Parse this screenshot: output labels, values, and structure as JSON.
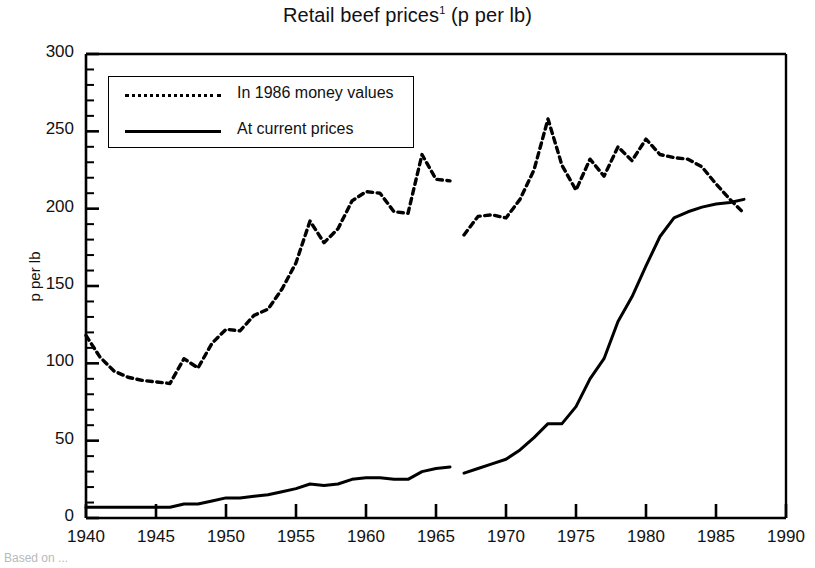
{
  "chart_data": {
    "type": "line",
    "title_main": "Retail beef prices",
    "title_superscript": "1",
    "title_suffix": " (p per lb)",
    "xlabel": "",
    "ylabel": "p per lb",
    "xlim": [
      1940,
      1990
    ],
    "ylim": [
      0,
      300
    ],
    "x_major_ticks": [
      1940,
      1945,
      1950,
      1955,
      1960,
      1965,
      1970,
      1975,
      1980,
      1985,
      1990
    ],
    "x_tick_labels": [
      "1940",
      "1945",
      "1950",
      "1955",
      "1960",
      "1965",
      "1970",
      "1975",
      "1980",
      "1985",
      "1990"
    ],
    "y_major_ticks": [
      0,
      50,
      100,
      150,
      200,
      250,
      300
    ],
    "y_tick_labels": [
      "0",
      "50",
      "100",
      "150",
      "200",
      "250",
      "300"
    ],
    "y_minor_step": 10,
    "grid": false,
    "legend_position": "upper-left-inside",
    "series": [
      {
        "name": "In 1986 money values",
        "style": "dashed",
        "color": "#000000",
        "segments": [
          {
            "x": [
              1940,
              1941,
              1942,
              1943,
              1944,
              1945,
              1946,
              1947,
              1948,
              1949,
              1950,
              1951,
              1952,
              1953,
              1954,
              1955,
              1956,
              1957,
              1958,
              1959,
              1960,
              1961,
              1962,
              1963,
              1964,
              1965,
              1966
            ],
            "y": [
              118,
              104,
              95,
              91,
              89,
              88,
              87,
              103,
              97,
              113,
              122,
              121,
              131,
              135,
              148,
              165,
              192,
              178,
              187,
              205,
              211,
              210,
              198,
              197,
              235,
              219,
              218
            ]
          },
          {
            "x": [
              1967,
              1968,
              1969,
              1970,
              1971,
              1972,
              1973,
              1974,
              1975,
              1976,
              1977,
              1978,
              1979,
              1980,
              1981,
              1982,
              1983,
              1984,
              1985,
              1986,
              1987
            ],
            "y": [
              183,
              195,
              196,
              194,
              206,
              225,
              258,
              228,
              212,
              232,
              221,
              240,
              231,
              245,
              235,
              233,
              232,
              227,
              216,
              206,
              197
            ]
          }
        ]
      },
      {
        "name": "At current prices",
        "style": "solid",
        "color": "#000000",
        "segments": [
          {
            "x": [
              1940,
              1941,
              1942,
              1943,
              1944,
              1945,
              1946,
              1947,
              1948,
              1949,
              1950,
              1951,
              1952,
              1953,
              1954,
              1955,
              1956,
              1957,
              1958,
              1959,
              1960,
              1961,
              1962,
              1963,
              1964,
              1965,
              1966
            ],
            "y": [
              7,
              7,
              7,
              7,
              7,
              7,
              7,
              9,
              9,
              11,
              13,
              13,
              14,
              15,
              17,
              19,
              22,
              21,
              22,
              25,
              26,
              26,
              25,
              25,
              30,
              32,
              33
            ]
          },
          {
            "x": [
              1967,
              1968,
              1969,
              1970,
              1971,
              1972,
              1973,
              1974,
              1975,
              1976,
              1977,
              1978,
              1979,
              1980,
              1981,
              1982,
              1983,
              1984,
              1985,
              1986,
              1987
            ],
            "y": [
              29,
              32,
              35,
              38,
              44,
              52,
              61,
              61,
              72,
              90,
              103,
              127,
              143,
              163,
              182,
              194,
              198,
              201,
              203,
              204,
              206
            ]
          }
        ]
      }
    ]
  },
  "legend": {
    "items": [
      {
        "label": "In 1986 money values",
        "style": "dashed"
      },
      {
        "label": "At current prices",
        "style": "solid"
      }
    ]
  },
  "footnote": "Based on ..."
}
